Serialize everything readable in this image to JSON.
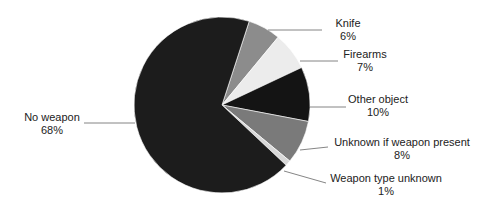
{
  "chart_data": {
    "type": "pie",
    "title": "",
    "start_angle_deg": 18,
    "direction": "clockwise",
    "slices": [
      {
        "label": "Knife",
        "value": 6,
        "pct_label": "6%",
        "color": "#8c8c8c"
      },
      {
        "label": "Firearms",
        "value": 7,
        "pct_label": "7%",
        "color": "#ececec"
      },
      {
        "label": "Other object",
        "value": 10,
        "pct_label": "10%",
        "color": "#141414"
      },
      {
        "label": "Unknown if weapon present",
        "value": 8,
        "pct_label": "8%",
        "color": "#7a7a7a"
      },
      {
        "label": "Weapon type unknown",
        "value": 1,
        "pct_label": "1%",
        "color": "#d8d8d8"
      },
      {
        "label": "No weapon",
        "value": 68,
        "pct_label": "68%",
        "color": "#1c1c1c"
      }
    ],
    "legend": "none (direct labels with leader lines)"
  },
  "labels": {
    "knife": {
      "name": "Knife",
      "pct": "6%"
    },
    "firearms": {
      "name": "Firearms",
      "pct": "7%"
    },
    "other": {
      "name": "Other object",
      "pct": "10%"
    },
    "unknown_present": {
      "name": "Unknown if weapon present",
      "pct": "8%"
    },
    "type_unknown": {
      "name": "Weapon type unknown",
      "pct": "1%"
    },
    "no_weapon": {
      "name": "No weapon",
      "pct": "68%"
    }
  }
}
